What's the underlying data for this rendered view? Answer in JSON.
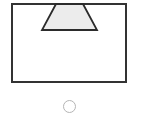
{
  "diagram": {
    "rectangle": {
      "x": 12,
      "y": 4,
      "width": 114,
      "height": 78,
      "stroke": "#333333"
    },
    "trapezoid": {
      "points": [
        [
          56,
          4
        ],
        [
          83,
          4
        ],
        [
          97,
          30
        ],
        [
          42,
          30
        ]
      ],
      "fill": "#ececec",
      "stroke": "#2b2b2b"
    }
  },
  "option": {
    "selected": false,
    "stroke": "#b5b5b5"
  }
}
